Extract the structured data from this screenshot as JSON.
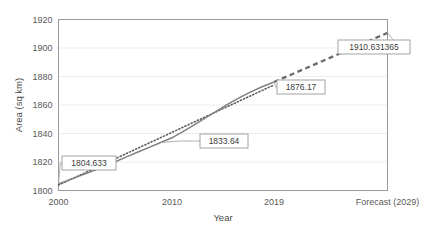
{
  "chart_data": {
    "type": "line",
    "title": "",
    "xlabel": "Year",
    "ylabel": "Area (sq km)",
    "grid": true,
    "legend": "none",
    "ylim": [
      1800,
      1920
    ],
    "ytick_labels": [
      "1920",
      "1900",
      "1880",
      "1860",
      "1840",
      "1820",
      "1800"
    ],
    "ytick_values": [
      1920,
      1900,
      1880,
      1860,
      1840,
      1820,
      1800
    ],
    "xtick_labels": [
      "2000",
      "2010",
      "2019",
      "Forecast (2029)"
    ],
    "xtick_values": [
      2000,
      2010,
      2019,
      2029
    ],
    "x": [
      2000,
      2001,
      2002,
      2003,
      2004,
      2005,
      2006,
      2007,
      2008,
      2009,
      2010,
      2011,
      2012,
      2013,
      2014,
      2015,
      2016,
      2017,
      2018,
      2019
    ],
    "series": [
      {
        "name": "Actual area",
        "style": "solid",
        "color": "#808080",
        "values": [
          1804.633,
          1807.6,
          1810.6,
          1813.7,
          1816.9,
          1820.2,
          1823.6,
          1827.0,
          1830.3,
          1833.64,
          1837.0,
          1841.5,
          1846.3,
          1851.2,
          1856.1,
          1861.0,
          1865.3,
          1869.4,
          1873.0,
          1876.17
        ]
      },
      {
        "name": "Trend line",
        "style": "dotted",
        "color": "#5f5f5f",
        "values": [
          1803.8,
          1807.5,
          1811.2,
          1814.9,
          1818.6,
          1822.3,
          1826.0,
          1829.7,
          1833.4,
          1837.1,
          1840.8,
          1844.5,
          1848.2,
          1851.9,
          1855.6,
          1859.3,
          1863.0,
          1866.7,
          1870.4,
          1874.1
        ]
      },
      {
        "name": "Forecast",
        "style": "dashed",
        "color": "#6b6b6b",
        "x": [
          2019,
          2029
        ],
        "values": [
          1876.17,
          1910.631365
        ]
      }
    ],
    "annotations": [
      {
        "label": "1804.633",
        "x": 2000,
        "y": 1804.633
      },
      {
        "label": "1833.64",
        "x": 2009,
        "y": 1833.64
      },
      {
        "label": "1876.17",
        "x": 2019,
        "y": 1876.17
      },
      {
        "label": "1910.631365",
        "x": 2029,
        "y": 1910.631365
      }
    ],
    "colors": {
      "plot_border": "#9a9a9a",
      "gridline": "#ededed",
      "axis_text": "#5a5a5a",
      "callout_border": "#9a9a9a",
      "callout_fill": "#ffffff",
      "leader_line": "#a8a8a8"
    }
  }
}
